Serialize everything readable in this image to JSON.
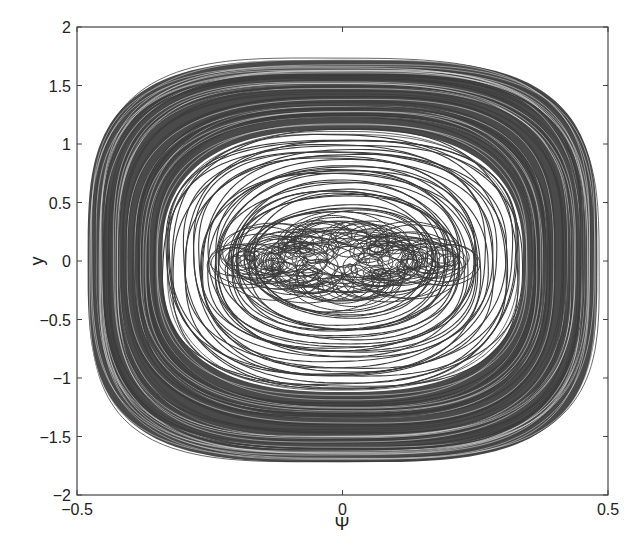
{
  "chart_data": {
    "type": "line",
    "subtype": "phase-portrait",
    "title": "",
    "xlabel": "Ψ",
    "ylabel": "y",
    "xlim": [
      -0.5,
      0.5
    ],
    "ylim": [
      -2,
      2
    ],
    "xticks": [
      -0.5,
      0,
      0.5
    ],
    "xtick_labels": [
      "-0.5",
      "0",
      "0.5"
    ],
    "yticks": [
      -2,
      -1.5,
      -1,
      -0.5,
      0,
      0.5,
      1,
      1.5,
      2
    ],
    "ytick_labels": [
      "-2",
      "-1.5",
      "-1",
      "-0.5",
      "0",
      "0.5",
      "1",
      "1.5",
      "2"
    ],
    "grid": false,
    "legend": null,
    "series": [
      {
        "name": "outer dense band (rounded-rectangle orbits)",
        "psi_extent": [
          0.33,
          0.48
        ],
        "y_extent": [
          1.1,
          1.72
        ],
        "count": 70
      },
      {
        "name": "middle orbits (oval)",
        "psi_extent": [
          0.16,
          0.34
        ],
        "y_extent": [
          0.45,
          1.12
        ],
        "count": 34
      },
      {
        "name": "inner looping trajectories",
        "psi_center_range": [
          -0.2,
          0.2
        ],
        "loop_radius_psi": [
          0.02,
          0.06
        ],
        "y_amplitude": [
          0.05,
          0.3
        ],
        "count": 26
      }
    ],
    "line_color": "#3a3a3a"
  },
  "figure": {
    "axes_color": "#444444",
    "background": "#ffffff"
  }
}
